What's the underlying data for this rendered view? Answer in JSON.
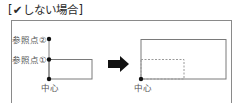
{
  "title": "[✔しない場合]",
  "before": {
    "labels": {
      "ref2": "参照点②",
      "ref1": "参照点①",
      "center": "中心"
    }
  },
  "after": {
    "labels": {
      "center": "中心"
    }
  },
  "colors": {
    "frame": "#8a8a8a",
    "line": "#7a7a7a",
    "dot": "#111111",
    "arrow": "#111111",
    "dashed": "#9a9a9a"
  }
}
